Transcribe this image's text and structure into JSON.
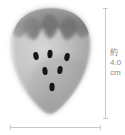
{
  "figure": {
    "rendering": "grayscale-photo-illustration",
    "background_color": "#ffffff"
  },
  "specimen": {
    "name": "strawberry-fruit",
    "body_color_light": "#e8e8e8",
    "body_color_mid": "#b4b4b4",
    "body_color_dark": "#8f8f8f",
    "calyx_color": "#6e6e6e",
    "seed_color": "#141414",
    "calyx_lobe_count": 3,
    "seed_count": 6,
    "seeds": [
      {
        "cx": 36,
        "cy": 56
      },
      {
        "cx": 50,
        "cy": 54
      },
      {
        "cx": 67,
        "cy": 57
      },
      {
        "cx": 45,
        "cy": 71
      },
      {
        "cx": 60,
        "cy": 70
      },
      {
        "cx": 52,
        "cy": 87
      }
    ]
  },
  "measurements": {
    "height": {
      "label_lines": [
        "約",
        "4.0",
        "cm"
      ],
      "approx_prefix": "約",
      "value": "4.0",
      "unit": "cm",
      "line_color": "#c8c8c8",
      "text_color": "#8a8a8a"
    },
    "width": {
      "label_lines": [],
      "line_color": "#c8c8c8"
    }
  }
}
